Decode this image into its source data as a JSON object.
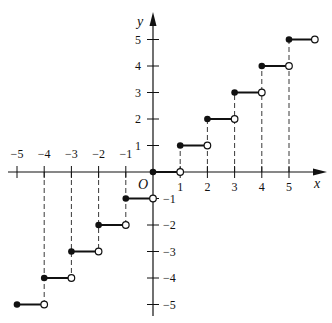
{
  "chart_data": {
    "type": "line",
    "title": "",
    "function": "floor(x) step function",
    "xlabel": "x",
    "ylabel": "y",
    "origin_label": "O",
    "xlim": [
      -5,
      5.5
    ],
    "ylim": [
      -5,
      5
    ],
    "grid": false,
    "x_ticks": [
      -5,
      -4,
      -3,
      -2,
      -1,
      1,
      2,
      3,
      4,
      5
    ],
    "x_tick_labels": [
      "−5",
      "−4",
      "−3",
      "−2",
      "−1",
      "1",
      "2",
      "3",
      "4",
      "5"
    ],
    "y_ticks": [
      5,
      4,
      3,
      2,
      1,
      -1,
      -2,
      -3,
      -4,
      -5
    ],
    "y_tick_labels": [
      "5",
      "4",
      "3",
      "2",
      "1",
      "−1",
      "−2",
      "−3",
      "−4",
      "−5"
    ],
    "segments": [
      {
        "x_start": -5,
        "x_end": -4,
        "y": -5,
        "start": "closed",
        "end": "open"
      },
      {
        "x_start": -4,
        "x_end": -3,
        "y": -4,
        "start": "closed",
        "end": "open"
      },
      {
        "x_start": -3,
        "x_end": -2,
        "y": -3,
        "start": "closed",
        "end": "open"
      },
      {
        "x_start": -2,
        "x_end": -1,
        "y": -2,
        "start": "closed",
        "end": "open"
      },
      {
        "x_start": -1,
        "x_end": 0,
        "y": -1,
        "start": "closed",
        "end": "open"
      },
      {
        "x_start": 0,
        "x_end": 1,
        "y": 0,
        "start": "closed",
        "end": "open"
      },
      {
        "x_start": 1,
        "x_end": 2,
        "y": 1,
        "start": "closed",
        "end": "open"
      },
      {
        "x_start": 2,
        "x_end": 3,
        "y": 2,
        "start": "closed",
        "end": "open"
      },
      {
        "x_start": 3,
        "x_end": 4,
        "y": 3,
        "start": "closed",
        "end": "open"
      },
      {
        "x_start": 4,
        "x_end": 5,
        "y": 4,
        "start": "closed",
        "end": "open"
      },
      {
        "x_start": 5,
        "x_end": 6,
        "y": 5,
        "start": "closed",
        "end": "open"
      }
    ],
    "dashed_guides": [
      {
        "x": -4,
        "from_y": 0,
        "to_y": -5
      },
      {
        "x": -3,
        "from_y": 0,
        "to_y": -4
      },
      {
        "x": -2,
        "from_y": 0,
        "to_y": -3
      },
      {
        "x": -1,
        "from_y": 0,
        "to_y": -2
      },
      {
        "x": 1,
        "from_y": 0,
        "to_y": 1
      },
      {
        "x": 2,
        "from_y": 0,
        "to_y": 2
      },
      {
        "x": 3,
        "from_y": 0,
        "to_y": 3
      },
      {
        "x": 4,
        "from_y": 0,
        "to_y": 4
      },
      {
        "x": 5,
        "from_y": 0,
        "to_y": 5
      }
    ]
  }
}
